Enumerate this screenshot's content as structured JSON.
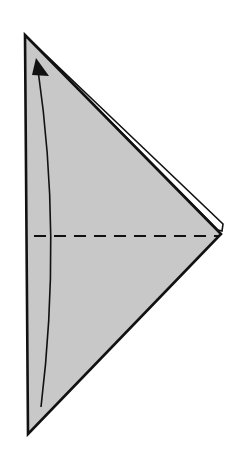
{
  "diagram": {
    "type": "origami-fold-step",
    "background": "#ffffff",
    "paper_fill": "#c8c8c8",
    "stroke": "#111111",
    "shape": {
      "top_apex": [
        25,
        35
      ],
      "right_point": [
        221,
        234
      ],
      "bottom_apex": [
        28,
        434
      ]
    },
    "back_layer_edge": {
      "from": [
        32,
        38
      ],
      "to": [
        222,
        224
      ]
    },
    "valley_fold_line": {
      "style": "dashed",
      "y": 236,
      "x_start": 34,
      "x_end": 219
    },
    "fold_arrow": {
      "direction": "up",
      "start": [
        41,
        407
      ],
      "end": [
        38,
        62
      ],
      "bow_x": 52
    }
  }
}
